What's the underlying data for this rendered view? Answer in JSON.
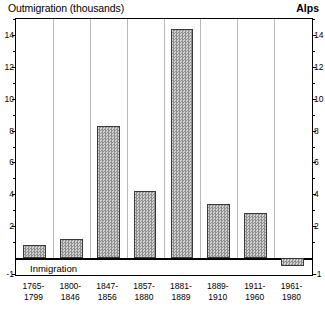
{
  "header": {
    "title": "Outmigration (thousands)",
    "region": "Alps"
  },
  "annotations": {
    "below_zero": "Inmigration"
  },
  "chart_data": {
    "type": "bar",
    "title": "Outmigration (thousands)",
    "subtitle": "Alps",
    "xlabel": "",
    "ylabel": "Outmigration (thousands)",
    "ylim": [
      -1,
      15
    ],
    "grid": "vertical-category-separators",
    "legend": "none",
    "ytick_labels": [
      "14",
      "12",
      "10",
      "8",
      "6",
      "4",
      "2",
      "-1"
    ],
    "ytick_values": [
      14,
      12,
      10,
      8,
      6,
      4,
      2,
      -1
    ],
    "yminor_values": [
      15,
      13,
      11,
      9,
      7,
      5,
      3,
      1
    ],
    "annotations": [
      {
        "text": "Inmigration",
        "meaning": "values below zero indicate immigration"
      }
    ],
    "categories": [
      "1765-1799",
      "1800-1846",
      "1847-1856",
      "1857-1880",
      "1881-1889",
      "1889-1910",
      "1911-1960",
      "1961-1980"
    ],
    "category_lines": [
      [
        "1765-",
        "1799"
      ],
      [
        "1800-",
        "1846"
      ],
      [
        "1847-",
        "1856"
      ],
      [
        "1857-",
        "1880"
      ],
      [
        "1881-",
        "1889"
      ],
      [
        "1889-",
        "1910"
      ],
      [
        "1911-",
        "1960"
      ],
      [
        "1961-",
        "1980"
      ]
    ],
    "values": [
      0.8,
      1.2,
      8.3,
      4.2,
      14.4,
      3.4,
      2.8,
      -0.5
    ],
    "bar_color": "#a9a9a9",
    "bar_edge_color": "#3a3a3a"
  }
}
